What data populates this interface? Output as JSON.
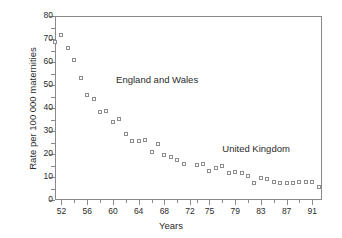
{
  "chart_data": {
    "type": "scatter",
    "title": "",
    "xlabel": "Years",
    "ylabel": "Rate per 100 000 maternities",
    "xlim": [
      51,
      92.5
    ],
    "ylim": [
      0,
      80
    ],
    "grid": false,
    "legend": "none",
    "y_ticks": [
      0,
      10,
      20,
      30,
      40,
      50,
      60,
      70,
      80
    ],
    "y_tick_labels": [
      "0",
      "10",
      "20",
      "30",
      "40",
      "50",
      "60",
      "70",
      "80"
    ],
    "y_minor_ticks": [
      5,
      15,
      25,
      35,
      45,
      55,
      65,
      75
    ],
    "x_ticks": [
      52,
      56,
      60,
      64,
      68,
      72,
      75,
      79,
      83,
      87,
      91
    ],
    "x_tick_labels": [
      "52",
      "56",
      "60",
      "64",
      "68",
      "72",
      "75",
      "79",
      "83",
      "87",
      "91"
    ],
    "x_minor_ticks": [
      54,
      58,
      62,
      66,
      70,
      73,
      77,
      81,
      85,
      89
    ],
    "annotations": [
      {
        "text": "England and Wales",
        "x": 60.5,
        "y": 52
      },
      {
        "text": "United Kingdom",
        "x": 77.0,
        "y": 22
      }
    ],
    "series": [
      {
        "name": "Maternal mortality rate",
        "marker": "open-square",
        "color": "#8d8d8d",
        "points": [
          {
            "x": 51,
            "y": 68.8
          },
          {
            "x": 52,
            "y": 71.8
          },
          {
            "x": 53,
            "y": 66.2
          },
          {
            "x": 54,
            "y": 61.0
          },
          {
            "x": 55,
            "y": 53.2
          },
          {
            "x": 56,
            "y": 45.5
          },
          {
            "x": 57,
            "y": 44.0
          },
          {
            "x": 58,
            "y": 38.4
          },
          {
            "x": 59,
            "y": 38.8
          },
          {
            "x": 60,
            "y": 34.0
          },
          {
            "x": 61,
            "y": 35.2
          },
          {
            "x": 62,
            "y": 28.6
          },
          {
            "x": 63,
            "y": 25.6
          },
          {
            "x": 64,
            "y": 25.5
          },
          {
            "x": 65,
            "y": 26.0
          },
          {
            "x": 66,
            "y": 21.0
          },
          {
            "x": 67,
            "y": 24.2
          },
          {
            "x": 68,
            "y": 19.4
          },
          {
            "x": 69,
            "y": 18.6
          },
          {
            "x": 70,
            "y": 17.2
          },
          {
            "x": 71,
            "y": 15.8
          },
          {
            "x": 73,
            "y": 15.3
          },
          {
            "x": 74,
            "y": 15.8
          },
          {
            "x": 75,
            "y": 12.6
          },
          {
            "x": 76,
            "y": 14.1
          },
          {
            "x": 77,
            "y": 14.7
          },
          {
            "x": 78,
            "y": 11.6
          },
          {
            "x": 79,
            "y": 12.2
          },
          {
            "x": 80,
            "y": 11.8
          },
          {
            "x": 81,
            "y": 10.6
          },
          {
            "x": 82,
            "y": 7.5
          },
          {
            "x": 83,
            "y": 9.4
          },
          {
            "x": 84,
            "y": 9.3
          },
          {
            "x": 85,
            "y": 7.7
          },
          {
            "x": 86,
            "y": 7.2
          },
          {
            "x": 87,
            "y": 7.4
          },
          {
            "x": 88,
            "y": 7.4
          },
          {
            "x": 89,
            "y": 7.9
          },
          {
            "x": 90,
            "y": 8.0
          },
          {
            "x": 91,
            "y": 8.0
          },
          {
            "x": 92,
            "y": 5.6
          }
        ]
      }
    ]
  }
}
